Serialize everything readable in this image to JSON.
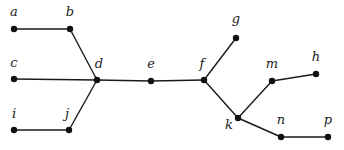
{
  "diagram": {
    "type": "tree-graph",
    "nodes": [
      {
        "id": "a",
        "label": "a",
        "x": 14,
        "y": 29,
        "lx": 14,
        "ly": 16
      },
      {
        "id": "b",
        "label": "b",
        "x": 70,
        "y": 29,
        "lx": 70,
        "ly": 16
      },
      {
        "id": "c",
        "label": "c",
        "x": 14,
        "y": 79,
        "lx": 14,
        "ly": 67
      },
      {
        "id": "d",
        "label": "d",
        "x": 97,
        "y": 80,
        "lx": 99,
        "ly": 68
      },
      {
        "id": "e",
        "label": "e",
        "x": 151,
        "y": 81,
        "lx": 151,
        "ly": 68
      },
      {
        "id": "f",
        "label": "f",
        "x": 204,
        "y": 80,
        "lx": 202,
        "ly": 68
      },
      {
        "id": "g",
        "label": "g",
        "x": 236,
        "y": 38,
        "lx": 236,
        "ly": 23
      },
      {
        "id": "h",
        "label": "h",
        "x": 316,
        "y": 74,
        "lx": 316,
        "ly": 61
      },
      {
        "id": "i",
        "label": "i",
        "x": 14,
        "y": 130,
        "lx": 14,
        "ly": 118
      },
      {
        "id": "j",
        "label": "j",
        "x": 69,
        "y": 130,
        "lx": 67,
        "ly": 118
      },
      {
        "id": "k",
        "label": "k",
        "x": 238,
        "y": 118,
        "lx": 229,
        "ly": 129
      },
      {
        "id": "m",
        "label": "m",
        "x": 272,
        "y": 81,
        "lx": 272,
        "ly": 68
      },
      {
        "id": "n",
        "label": "n",
        "x": 281,
        "y": 137,
        "lx": 281,
        "ly": 124
      },
      {
        "id": "p",
        "label": "p",
        "x": 328,
        "y": 137,
        "lx": 328,
        "ly": 124
      }
    ],
    "edges": [
      [
        "a",
        "b"
      ],
      [
        "b",
        "d"
      ],
      [
        "c",
        "d"
      ],
      [
        "i",
        "j"
      ],
      [
        "j",
        "d"
      ],
      [
        "d",
        "e"
      ],
      [
        "e",
        "f"
      ],
      [
        "f",
        "g"
      ],
      [
        "f",
        "k"
      ],
      [
        "k",
        "m"
      ],
      [
        "m",
        "h"
      ],
      [
        "k",
        "n"
      ],
      [
        "n",
        "p"
      ]
    ]
  }
}
